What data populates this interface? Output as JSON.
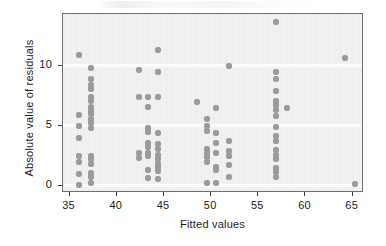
{
  "chart_data": {
    "type": "scatter",
    "title": "",
    "xlabel": "Fitted values",
    "ylabel": "Absolute value of residuals",
    "xlim": [
      34.3,
      66.2
    ],
    "ylim": [
      -0.6,
      14.3
    ],
    "xticks": [
      35,
      40,
      45,
      50,
      55,
      60,
      65
    ],
    "xticklabels": [
      "35",
      "40",
      "45",
      "50",
      "55",
      "60",
      "65"
    ],
    "yticks": [
      0,
      5,
      10
    ],
    "yticklabels": [
      "0",
      "5",
      "10"
    ],
    "grid": "horizontal-white-at-yticks",
    "legend": "none",
    "marker": "filled-circle",
    "marker_color": "#9b9b9b",
    "panel_color": "#eeeeee",
    "border_color": "#6f6f6f",
    "points": [
      [
        35.95,
        10.85
      ],
      [
        35.95,
        5.9
      ],
      [
        35.95,
        5.0
      ],
      [
        35.95,
        4.0
      ],
      [
        35.95,
        2.45
      ],
      [
        35.95,
        2.0
      ],
      [
        35.95,
        1.0
      ],
      [
        35.95,
        0.05
      ],
      [
        37.25,
        9.8
      ],
      [
        37.25,
        8.85
      ],
      [
        37.25,
        8.35
      ],
      [
        37.25,
        8.05
      ],
      [
        37.25,
        7.4
      ],
      [
        37.25,
        7.05
      ],
      [
        37.25,
        6.55
      ],
      [
        37.25,
        6.2
      ],
      [
        37.25,
        5.95
      ],
      [
        37.25,
        5.6
      ],
      [
        37.25,
        5.2
      ],
      [
        37.25,
        4.8
      ],
      [
        37.25,
        2.45
      ],
      [
        37.25,
        2.2
      ],
      [
        37.25,
        1.8
      ],
      [
        37.25,
        1.05
      ],
      [
        37.25,
        0.7
      ],
      [
        37.25,
        0.2
      ],
      [
        42.35,
        9.6
      ],
      [
        42.35,
        7.35
      ],
      [
        42.35,
        2.7
      ],
      [
        42.35,
        2.35
      ],
      [
        43.35,
        7.35
      ],
      [
        43.35,
        6.55
      ],
      [
        43.35,
        4.85
      ],
      [
        43.35,
        4.45
      ],
      [
        43.35,
        3.55
      ],
      [
        43.35,
        3.25
      ],
      [
        43.35,
        2.75
      ],
      [
        43.35,
        2.45
      ],
      [
        43.35,
        1.3
      ],
      [
        43.35,
        0.65
      ],
      [
        44.4,
        11.3
      ],
      [
        44.4,
        9.45
      ],
      [
        44.4,
        7.35
      ],
      [
        44.4,
        4.4
      ],
      [
        44.4,
        3.45
      ],
      [
        44.4,
        3.05
      ],
      [
        44.4,
        2.6
      ],
      [
        44.4,
        2.25
      ],
      [
        44.4,
        1.85
      ],
      [
        44.4,
        1.55
      ],
      [
        44.4,
        1.25
      ],
      [
        44.4,
        0.55
      ],
      [
        48.55,
        6.95
      ],
      [
        49.55,
        5.55
      ],
      [
        49.55,
        4.95
      ],
      [
        49.55,
        4.55
      ],
      [
        49.55,
        3.05
      ],
      [
        49.55,
        2.7
      ],
      [
        49.55,
        2.4
      ],
      [
        49.55,
        1.95
      ],
      [
        49.55,
        0.25
      ],
      [
        50.55,
        6.5
      ],
      [
        50.55,
        4.4
      ],
      [
        50.55,
        3.55
      ],
      [
        50.55,
        2.75
      ],
      [
        50.55,
        1.55
      ],
      [
        50.55,
        1.3
      ],
      [
        50.55,
        0.25
      ],
      [
        51.85,
        9.95
      ],
      [
        51.85,
        3.75
      ],
      [
        51.85,
        2.9
      ],
      [
        51.85,
        2.45
      ],
      [
        51.85,
        1.75
      ],
      [
        51.85,
        0.7
      ],
      [
        56.9,
        13.65
      ],
      [
        56.9,
        9.45
      ],
      [
        56.9,
        8.9
      ],
      [
        56.9,
        7.9
      ],
      [
        56.9,
        7.05
      ],
      [
        56.9,
        6.7
      ],
      [
        56.9,
        6.35
      ],
      [
        56.9,
        5.85
      ],
      [
        56.9,
        4.9
      ],
      [
        56.9,
        4.15
      ],
      [
        56.9,
        3.75
      ],
      [
        56.9,
        3.0
      ],
      [
        56.9,
        2.6
      ],
      [
        56.9,
        2.25
      ],
      [
        56.9,
        1.45
      ],
      [
        56.9,
        1.15
      ],
      [
        56.9,
        0.75
      ],
      [
        58.0,
        6.45
      ],
      [
        64.2,
        10.6
      ],
      [
        65.2,
        0.15
      ]
    ]
  }
}
